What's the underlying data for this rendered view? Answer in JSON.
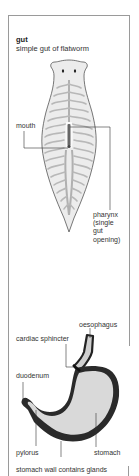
{
  "flatworm_panel": {
    "title": "gut",
    "subtitle": "simple gut of flatworm",
    "labels": {
      "mouth": "mouth",
      "pharynx": "pharynx\n(single\ngut\nopening)"
    }
  },
  "stomach_panel": {
    "labels": {
      "oesophagus": "oesophagus",
      "cardiac_sphincter": "cardiac sphincter",
      "duodenum": "duodenum",
      "pylorus": "pylorus",
      "stomach": "stomach",
      "stomach_wall": "stomach wall contains glands"
    }
  },
  "colors": {
    "body_fill": "#ececec",
    "gut_branch": "#b8b8b8",
    "outline": "#555555",
    "stomach_wall": "#2a2a2a",
    "stomach_fill": "#d9d9d9",
    "frame": "#9a9a9a"
  }
}
